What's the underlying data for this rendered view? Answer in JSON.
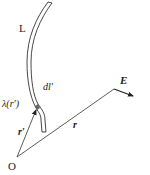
{
  "figure": {
    "type": "line-charge-field-diagram",
    "labels": {
      "curve": "L",
      "element": "dl′",
      "density": "λ(r′)",
      "origin": "O",
      "source_vector": "r′",
      "field_point_vector": "r",
      "field": "E"
    },
    "colors": {
      "stroke": "#333333",
      "text": "#222222",
      "background": "#ffffff"
    }
  }
}
